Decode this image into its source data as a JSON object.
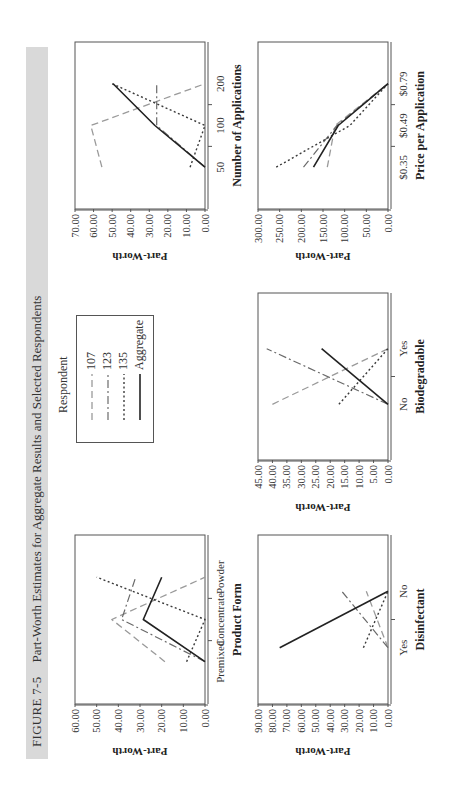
{
  "figure": {
    "label": "FIGURE 7-5",
    "title": "Part-Worth Estimates for Aggregate Results and Selected Respondents"
  },
  "legend": {
    "title": "Respondent",
    "items": [
      {
        "label": "107",
        "style": "dashed-light"
      },
      {
        "label": "123",
        "style": "dashdot"
      },
      {
        "label": "135",
        "style": "dotted"
      },
      {
        "label": "Aggregate",
        "style": "solid"
      }
    ]
  },
  "chart_data": [
    {
      "type": "line",
      "id": "product-form",
      "title": "",
      "xlabel": "Product Form",
      "ylabel": "Part-Worth",
      "categories": [
        "Premixed",
        "Concentrate",
        "Powder"
      ],
      "ylim": [
        0,
        60
      ],
      "yticks": [
        "0.00",
        "10.00",
        "20.00",
        "30.00",
        "40.00",
        "50.00",
        "60.00"
      ],
      "grid": false,
      "series": [
        {
          "name": "107",
          "values": [
            18.5,
            43,
            0
          ]
        },
        {
          "name": "123",
          "values": [
            0,
            38.5,
            32
          ]
        },
        {
          "name": "135",
          "values": [
            8.5,
            0,
            50
          ]
        },
        {
          "name": "Aggregate",
          "values": [
            0,
            28.5,
            20
          ]
        }
      ]
    },
    {
      "type": "line",
      "id": "number-of-applications",
      "title": "",
      "xlabel": "Number of Applications",
      "ylabel": "Part-Worth",
      "categories": [
        "50",
        "100",
        "200"
      ],
      "ylim": [
        0,
        70
      ],
      "yticks": [
        "0.00",
        "10.00",
        "20.00",
        "30.00",
        "40.00",
        "50.00",
        "60.00",
        "70.00"
      ],
      "grid": false,
      "series": [
        {
          "name": "107",
          "values": [
            55.5,
            61.5,
            0
          ]
        },
        {
          "name": "123",
          "values": [
            0,
            26,
            26
          ]
        },
        {
          "name": "135",
          "values": [
            8,
            0,
            50
          ]
        },
        {
          "name": "Aggregate",
          "values": [
            0,
            27,
            49.5
          ]
        }
      ]
    },
    {
      "type": "line",
      "id": "disinfectant",
      "title": "",
      "xlabel": "Disinfectant",
      "ylabel": "Part-Worth",
      "categories": [
        "Yes",
        "No"
      ],
      "ylim": [
        0,
        90
      ],
      "yticks": [
        "0.00",
        "10.00",
        "20.00",
        "30.00",
        "40.00",
        "50.00",
        "60.00",
        "70.00",
        "80.00",
        "90.00"
      ],
      "grid": false,
      "series": [
        {
          "name": "107",
          "values": [
            0,
            15
          ]
        },
        {
          "name": "123",
          "values": [
            0,
            32
          ]
        },
        {
          "name": "135",
          "values": [
            17,
            0
          ]
        },
        {
          "name": "Aggregate",
          "values": [
            75,
            0
          ]
        }
      ]
    },
    {
      "type": "line",
      "id": "biodegradable",
      "title": "",
      "xlabel": "Biodegradable",
      "ylabel": "Part-Worth",
      "categories": [
        "No",
        "Yes"
      ],
      "ylim": [
        0,
        45
      ],
      "yticks": [
        "0.00",
        "5.00",
        "10.00",
        "15.00",
        "20.00",
        "25.00",
        "30.00",
        "35.00",
        "40.00",
        "45.00"
      ],
      "grid": false,
      "series": [
        {
          "name": "107",
          "values": [
            40,
            0
          ]
        },
        {
          "name": "123",
          "values": [
            0,
            42
          ]
        },
        {
          "name": "135",
          "values": [
            17,
            0
          ]
        },
        {
          "name": "Aggregate",
          "values": [
            0,
            23
          ]
        }
      ]
    },
    {
      "type": "line",
      "id": "price-per-application",
      "title": "",
      "xlabel": "Price per Application",
      "ylabel": "Part-Worth",
      "categories": [
        "$0.35",
        "$0.49",
        "$0.79"
      ],
      "ylim": [
        0,
        300
      ],
      "yticks": [
        "0.00",
        "50.00",
        "100.00",
        "150.00",
        "200.00",
        "250.00",
        "300.00"
      ],
      "grid": false,
      "series": [
        {
          "name": "107",
          "values": [
            140,
            122,
            0
          ]
        },
        {
          "name": "123",
          "values": [
            195,
            118,
            0
          ]
        },
        {
          "name": "135",
          "values": [
            258,
            88,
            0
          ]
        },
        {
          "name": "Aggregate",
          "values": [
            172,
            115,
            0
          ]
        }
      ]
    }
  ],
  "styles": {
    "107": {
      "color": "#9a9a9a",
      "dash": "7,4",
      "width": 1.3
    },
    "123": {
      "color": "#6a6a6a",
      "dash": "8,3,2,3",
      "width": 1.2
    },
    "135": {
      "color": "#3a3a3a",
      "dash": "2,2.5",
      "width": 1.4
    },
    "Aggregate": {
      "color": "#222222",
      "dash": "",
      "width": 1.6
    }
  }
}
